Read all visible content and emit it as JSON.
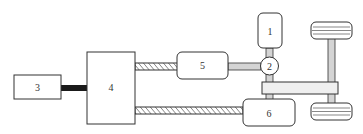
{
  "diagram": {
    "type": "hybrid-powertrain-schematic",
    "colors": {
      "stroke": "#333333",
      "shaft_grey": "#d4d4d4",
      "connector_black": "#1a1a1a",
      "background": "#ffffff"
    },
    "components": [
      {
        "id": "1",
        "label": "1"
      },
      {
        "id": "2",
        "label": "2"
      },
      {
        "id": "3",
        "label": "3"
      },
      {
        "id": "4",
        "label": "4"
      },
      {
        "id": "5",
        "label": "5"
      },
      {
        "id": "6",
        "label": "6"
      }
    ],
    "connections": [
      {
        "from": "3",
        "to": "4",
        "style": "thick-black"
      },
      {
        "from": "4",
        "to": "5",
        "style": "hatched"
      },
      {
        "from": "4",
        "to": "6",
        "style": "hatched"
      },
      {
        "from": "5",
        "to": "2",
        "style": "grey-shaft"
      },
      {
        "from": "1",
        "to": "2",
        "style": "grey-shaft"
      },
      {
        "from": "2",
        "to": "transfer-bar",
        "style": "grey-shaft"
      },
      {
        "from": "transfer-bar",
        "to": "6",
        "style": "grey-shaft"
      },
      {
        "from": "transfer-bar",
        "to": "axle",
        "style": "bar"
      }
    ]
  }
}
